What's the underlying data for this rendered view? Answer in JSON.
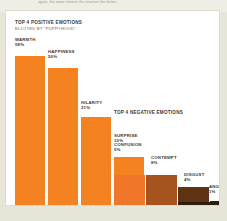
{
  "page": {
    "background_color": "#e8e6d8",
    "card_color": "#ffffff",
    "cut_off_text": "again, the more intense the reaction the better."
  },
  "positive": {
    "title": "TOP 4 POSITIVE EMOTIONS",
    "subtitle": "ELICITED BY \"PUPPYHOOD\""
  },
  "negative": {
    "title": "TOP 4 NEGATIVE EMOTIONS"
  },
  "chart_data": {
    "type": "bar",
    "xlabel": "",
    "ylabel": "",
    "ylim": [
      0,
      60
    ],
    "grid": false,
    "legend": "none",
    "groups": [
      {
        "name": "TOP 4 POSITIVE EMOTIONS",
        "subtitle": "ELICITED BY \"PUPPYHOOD\"",
        "categories": [
          "WARMTH",
          "HAPPINESS",
          "HILARITY",
          "SURPRISE"
        ],
        "values": [
          58,
          50,
          21,
          10
        ],
        "value_labels": [
          "58%",
          "50%",
          "21%",
          "10%"
        ],
        "colors": [
          "#f58220",
          "#f58220",
          "#f58220",
          "#f58220"
        ]
      },
      {
        "name": "TOP 4 NEGATIVE EMOTIONS",
        "categories": [
          "CONFUSION",
          "CONTEMPT",
          "DISGUST",
          "ANGER"
        ],
        "values": [
          5,
          8,
          4,
          1
        ],
        "value_labels": [
          "5%",
          "8%",
          "4%",
          "1%"
        ],
        "colors": [
          "#f0772a",
          "#a6541f",
          "#6b3a16",
          "#3d2410"
        ]
      }
    ]
  }
}
